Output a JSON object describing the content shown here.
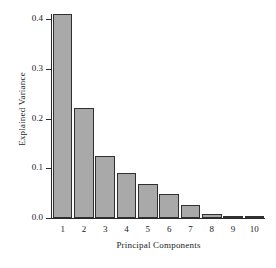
{
  "chart_data": {
    "type": "bar",
    "title": "",
    "xlabel": "Principal Components",
    "ylabel": "Explained Variance",
    "categories": [
      "1",
      "2",
      "3",
      "4",
      "5",
      "6",
      "7",
      "8",
      "9",
      "10"
    ],
    "values": [
      0.41,
      0.222,
      0.125,
      0.091,
      0.068,
      0.048,
      0.026,
      0.009,
      0.004,
      0.001
    ],
    "ylim": [
      0.0,
      0.41
    ],
    "yticks": [
      0.0,
      0.1,
      0.2,
      0.3,
      0.4
    ],
    "ytick_labels": [
      "0.0",
      "0.1",
      "0.2",
      "0.3",
      "0.4"
    ],
    "grid": false,
    "legend": null,
    "bar_fill_color": "#a9a9a9",
    "bar_edge_color": "#303030",
    "axis_color": "#2b2b2b",
    "background_color": "#ffffff"
  }
}
